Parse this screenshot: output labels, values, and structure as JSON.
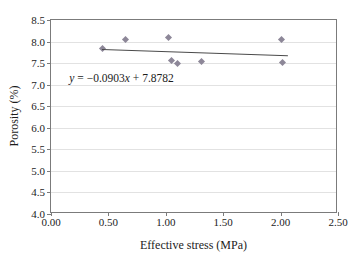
{
  "chart_data": {
    "type": "scatter",
    "title": "",
    "xlabel": "Effective stress (MPa)",
    "ylabel": "Porosity (%)",
    "xlim": [
      0.0,
      2.5
    ],
    "ylim": [
      4.0,
      8.5
    ],
    "grid": true,
    "legend": "none",
    "x_ticks": [
      "0.00",
      "0.50",
      "1.00",
      "1.50",
      "2.00",
      "2.50"
    ],
    "x_tick_values": [
      0.0,
      0.5,
      1.0,
      1.5,
      2.0,
      2.5
    ],
    "y_ticks": [
      "4.0",
      "4.5",
      "5.0",
      "5.5",
      "6.0",
      "6.5",
      "7.0",
      "7.5",
      "8.0",
      "8.5"
    ],
    "y_tick_values": [
      4.0,
      4.5,
      5.0,
      5.5,
      6.0,
      6.5,
      7.0,
      7.5,
      8.0,
      8.5
    ],
    "series": [
      {
        "name": "Porosity measurements",
        "marker": "diamond",
        "color": "#8d8798",
        "points": [
          {
            "x": 0.45,
            "y": 7.84
          },
          {
            "x": 0.65,
            "y": 8.05
          },
          {
            "x": 1.02,
            "y": 8.1
          },
          {
            "x": 1.05,
            "y": 7.56
          },
          {
            "x": 1.1,
            "y": 7.48
          },
          {
            "x": 1.31,
            "y": 7.54
          },
          {
            "x": 2.01,
            "y": 8.05
          },
          {
            "x": 2.02,
            "y": 7.52
          }
        ]
      }
    ],
    "trendline": {
      "type": "linear",
      "slope": -0.0903,
      "intercept": 7.8782,
      "color": "#4a4a4a",
      "x_start": 0.44,
      "x_end": 2.06,
      "equation_parts": {
        "y_symbol": "y",
        "equals": " = −0.0903",
        "x_symbol": "x",
        "tail": " + 7.8782"
      },
      "equation_text": "y = −0.0903x + 7.8782",
      "equation_position": {
        "x": 0.16,
        "y": 7.15
      }
    }
  },
  "edge_artifacts": [
    {
      "text": "·",
      "top": 14
    },
    {
      "text": "·",
      "top": 96
    },
    {
      "text": "·",
      "top": 112
    },
    {
      "text": "·",
      "top": 132
    },
    {
      "text": "·",
      "top": 150
    },
    {
      "text": "·",
      "top": 168
    },
    {
      "text": "·",
      "top": 232
    }
  ]
}
